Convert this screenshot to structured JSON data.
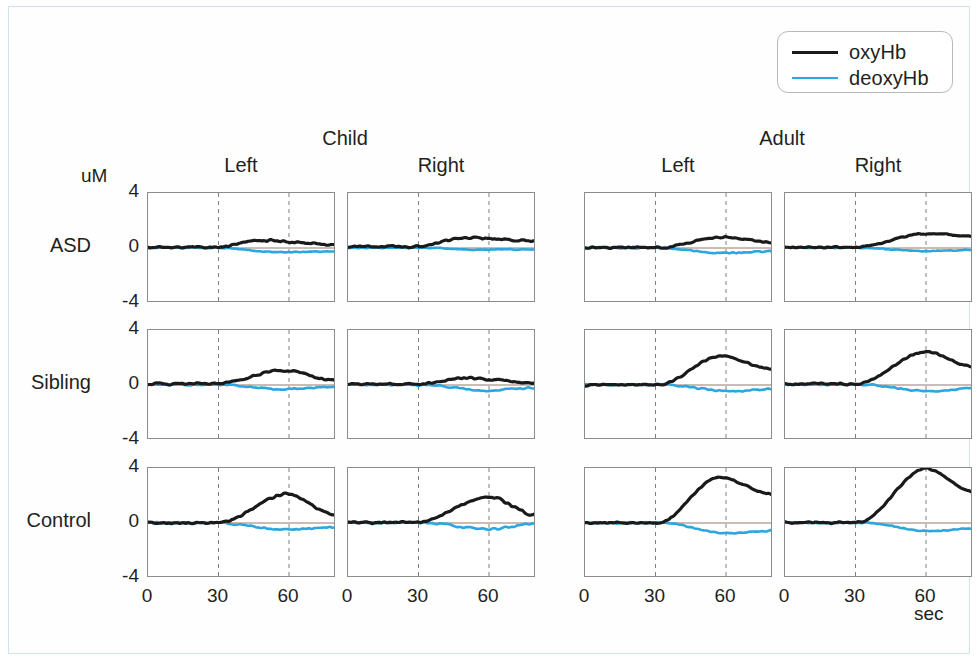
{
  "figure": {
    "unit_label": "uM",
    "x_unit_label": "sec",
    "y_ticks": [
      "4",
      "0",
      "-4"
    ],
    "x_ticks": [
      "0",
      "30",
      "60"
    ],
    "frame_color": "#cfe4ef",
    "panel_border_color": "#8c8c8c",
    "marker_line_color": "#808080",
    "baseline_color": "#8a6a5a"
  },
  "legend": {
    "items": [
      {
        "label": "oxyHb",
        "color": "#1a1a1a",
        "width": 3.2
      },
      {
        "label": "deoxyHb",
        "color": "#2ba6de",
        "width": 2.6
      }
    ]
  },
  "groups": [
    {
      "id": "child",
      "label": "Child"
    },
    {
      "id": "adult",
      "label": "Adult"
    }
  ],
  "columns": [
    {
      "id": "child-left",
      "group": "child",
      "label": "Left"
    },
    {
      "id": "child-right",
      "group": "child",
      "label": "Right"
    },
    {
      "id": "adult-left",
      "group": "adult",
      "label": "Left"
    },
    {
      "id": "adult-right",
      "group": "adult",
      "label": "Right"
    }
  ],
  "rows": [
    {
      "id": "asd",
      "label": "ASD"
    },
    {
      "id": "sibling",
      "label": "Sibling"
    },
    {
      "id": "control",
      "label": "Control"
    }
  ],
  "chart_data": {
    "type": "line",
    "title": "",
    "xlabel": "sec",
    "ylabel": "uM",
    "xlim": [
      0,
      80
    ],
    "ylim": [
      -4,
      4
    ],
    "grid": false,
    "legend_position": "top-right",
    "task_markers_sec": [
      30,
      60
    ],
    "baseline_y": 0,
    "series_names": [
      "oxyHb",
      "deoxyHb"
    ],
    "panels": [
      {
        "row": "ASD",
        "group": "Child",
        "side": "Left",
        "oxyHb": {
          "peak": 0.55,
          "peak_time": 48,
          "rise_start": 28,
          "end_value": 0.25,
          "baseline": 0.05,
          "noise": 0.12,
          "seed": 11
        },
        "deoxyHb": {
          "peak": -0.3,
          "peak_time": 55,
          "rise_start": 30,
          "end_value": -0.25,
          "baseline": 0.02,
          "noise": 0.07,
          "seed": 12
        }
      },
      {
        "row": "ASD",
        "group": "Child",
        "side": "Right",
        "oxyHb": {
          "peak": 0.75,
          "peak_time": 52,
          "rise_start": 26,
          "end_value": 0.5,
          "baseline": 0.1,
          "noise": 0.11,
          "seed": 21
        },
        "deoxyHb": {
          "peak": -0.12,
          "peak_time": 55,
          "rise_start": 30,
          "end_value": -0.1,
          "baseline": 0.02,
          "noise": 0.05,
          "seed": 22
        }
      },
      {
        "row": "ASD",
        "group": "Adult",
        "side": "Left",
        "oxyHb": {
          "peak": 0.8,
          "peak_time": 58,
          "rise_start": 32,
          "end_value": 0.4,
          "baseline": 0.03,
          "noise": 0.1,
          "seed": 31
        },
        "deoxyHb": {
          "peak": -0.35,
          "peak_time": 56,
          "rise_start": 32,
          "end_value": -0.25,
          "baseline": 0.02,
          "noise": 0.08,
          "seed": 32
        }
      },
      {
        "row": "ASD",
        "group": "Adult",
        "side": "Right",
        "oxyHb": {
          "peak": 1.05,
          "peak_time": 60,
          "rise_start": 30,
          "end_value": 0.85,
          "baseline": 0.05,
          "noise": 0.1,
          "seed": 41
        },
        "deoxyHb": {
          "peak": -0.22,
          "peak_time": 58,
          "rise_start": 32,
          "end_value": -0.15,
          "baseline": 0.02,
          "noise": 0.06,
          "seed": 42
        }
      },
      {
        "row": "Sibling",
        "group": "Child",
        "side": "Left",
        "oxyHb": {
          "peak": 1.05,
          "peak_time": 58,
          "rise_start": 28,
          "end_value": 0.35,
          "baseline": 0.08,
          "noise": 0.13,
          "seed": 51
        },
        "deoxyHb": {
          "peak": -0.3,
          "peak_time": 55,
          "rise_start": 30,
          "end_value": -0.15,
          "baseline": 0.02,
          "noise": 0.09,
          "seed": 52
        }
      },
      {
        "row": "Sibling",
        "group": "Child",
        "side": "Right",
        "oxyHb": {
          "peak": 0.5,
          "peak_time": 50,
          "rise_start": 28,
          "end_value": 0.15,
          "baseline": 0.05,
          "noise": 0.12,
          "seed": 61
        },
        "deoxyHb": {
          "peak": -0.4,
          "peak_time": 58,
          "rise_start": 32,
          "end_value": -0.2,
          "baseline": 0.02,
          "noise": 0.09,
          "seed": 62
        }
      },
      {
        "row": "Sibling",
        "group": "Adult",
        "side": "Left",
        "oxyHb": {
          "peak": 2.1,
          "peak_time": 58,
          "rise_start": 31,
          "end_value": 1.15,
          "baseline": 0.02,
          "noise": 0.11,
          "seed": 71
        },
        "deoxyHb": {
          "peak": -0.45,
          "peak_time": 62,
          "rise_start": 33,
          "end_value": -0.3,
          "baseline": 0.02,
          "noise": 0.1,
          "seed": 72
        }
      },
      {
        "row": "Sibling",
        "group": "Adult",
        "side": "Right",
        "oxyHb": {
          "peak": 2.4,
          "peak_time": 60,
          "rise_start": 30,
          "end_value": 1.35,
          "baseline": 0.08,
          "noise": 0.12,
          "seed": 81
        },
        "deoxyHb": {
          "peak": -0.45,
          "peak_time": 62,
          "rise_start": 33,
          "end_value": -0.25,
          "baseline": 0.02,
          "noise": 0.09,
          "seed": 82
        }
      },
      {
        "row": "Control",
        "group": "Child",
        "side": "Left",
        "oxyHb": {
          "peak": 2.1,
          "peak_time": 59,
          "rise_start": 30,
          "end_value": 0.55,
          "baseline": 0.0,
          "noise": 0.13,
          "seed": 91
        },
        "deoxyHb": {
          "peak": -0.5,
          "peak_time": 58,
          "rise_start": 31,
          "end_value": -0.3,
          "baseline": 0.02,
          "noise": 0.1,
          "seed": 92
        }
      },
      {
        "row": "Control",
        "group": "Child",
        "side": "Right",
        "oxyHb": {
          "peak": 1.9,
          "peak_time": 60,
          "rise_start": 29,
          "end_value": 0.6,
          "baseline": 0.05,
          "noise": 0.15,
          "seed": 101
        },
        "deoxyHb": {
          "peak": -0.45,
          "peak_time": 60,
          "rise_start": 32,
          "end_value": -0.05,
          "baseline": 0.02,
          "noise": 0.12,
          "seed": 102
        }
      },
      {
        "row": "Control",
        "group": "Adult",
        "side": "Left",
        "oxyHb": {
          "peak": 3.3,
          "peak_time": 57,
          "rise_start": 31,
          "end_value": 2.1,
          "baseline": 0.0,
          "noise": 0.09,
          "seed": 111
        },
        "deoxyHb": {
          "peak": -0.75,
          "peak_time": 62,
          "rise_start": 32,
          "end_value": -0.55,
          "baseline": 0.02,
          "noise": 0.09,
          "seed": 112
        }
      },
      {
        "row": "Control",
        "group": "Adult",
        "side": "Right",
        "oxyHb": {
          "peak": 3.95,
          "peak_time": 60,
          "rise_start": 31,
          "end_value": 2.3,
          "baseline": 0.02,
          "noise": 0.1,
          "seed": 121
        },
        "deoxyHb": {
          "peak": -0.6,
          "peak_time": 62,
          "rise_start": 33,
          "end_value": -0.4,
          "baseline": 0.02,
          "noise": 0.08,
          "seed": 122
        }
      }
    ]
  },
  "layout": {
    "panel_width": 188,
    "panel_height": 110,
    "col_x": [
      138,
      338,
      575,
      775
    ],
    "row_y": [
      185,
      322,
      460
    ],
    "group_center_x": [
      336,
      773
    ],
    "group_label_y": 120,
    "col_label_y": 147,
    "unit_x": 72,
    "unit_y": 158,
    "xunit_x": 905,
    "xunit_y": 596
  }
}
